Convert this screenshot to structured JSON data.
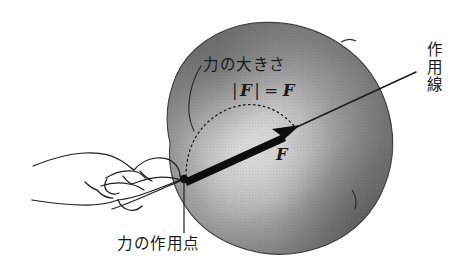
{
  "figure": {
    "background_color": "#ffffff",
    "width": 469,
    "height": 277
  },
  "labels": {
    "magnitude_of_force": "力の大きさ",
    "formula": {
      "bar_left": "|",
      "vector_f": "F",
      "bar_right": "|",
      "equals": "=",
      "scalar_f": "F"
    },
    "force_vector": "F",
    "line_of_action": "作用線",
    "point_of_application": "力の作用点"
  },
  "colors": {
    "ink": "#1a1a1a",
    "ball_highlight": "#f2f2f2",
    "ball_mid": "#9a9a9a",
    "ball_shadow": "#5c5c5c",
    "ball_edge": "#4a4a4a",
    "background": "#ffffff"
  },
  "geometry": {
    "application_point": {
      "x": 184,
      "y": 179
    },
    "arrow_tip": {
      "x": 297,
      "y": 127
    },
    "action_line_end": {
      "x": 416,
      "y": 72
    },
    "caption_leader_end": {
      "x": 184,
      "y": 233
    }
  }
}
